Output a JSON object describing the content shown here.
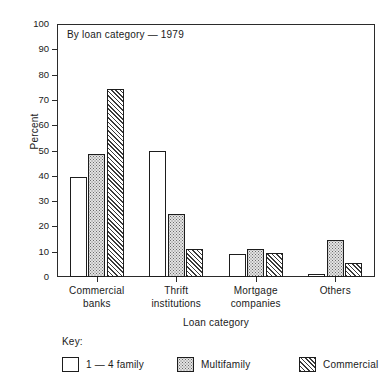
{
  "chart_data": {
    "type": "bar",
    "title": "By loan category — 1979",
    "xlabel": "Loan category",
    "ylabel": "Percent",
    "ylim": [
      0,
      100
    ],
    "ytick_step": 10,
    "yticks": [
      0,
      10,
      20,
      30,
      40,
      50,
      60,
      70,
      80,
      90,
      100
    ],
    "ytick_labels": [
      "0",
      "10",
      "20",
      "30",
      "40",
      "50",
      "60",
      "70",
      "80",
      "90",
      "100"
    ],
    "grid": false,
    "legend_position": "below-left",
    "legend_title": "Key:",
    "categories": [
      "Commercial banks",
      "Thrift institutions",
      "Mortgage companies",
      "Others"
    ],
    "category_lines": [
      [
        "Commercial",
        "banks"
      ],
      [
        "Thrift",
        "institutions"
      ],
      [
        "Mortgage",
        "companies"
      ],
      [
        "Others",
        ""
      ]
    ],
    "series": [
      {
        "name": "1 — 4 family",
        "pattern": "plain",
        "values": [
          39.5,
          50,
          9,
          1
        ]
      },
      {
        "name": "Multifamily",
        "pattern": "dots",
        "values": [
          48.5,
          25,
          11,
          14.5
        ]
      },
      {
        "name": "Commercial",
        "pattern": "hatch",
        "values": [
          74.5,
          11,
          9.5,
          5.5
        ]
      }
    ]
  },
  "colors": {
    "axis": "#2b2b2b",
    "bar_outline": "#1d1d1d",
    "plain_fill": "#ffffff",
    "dots_fill": "#e3e3e3",
    "hatch_fill": "#dcdcdc",
    "background": "#ffffff",
    "text": "#1a1a1a"
  }
}
